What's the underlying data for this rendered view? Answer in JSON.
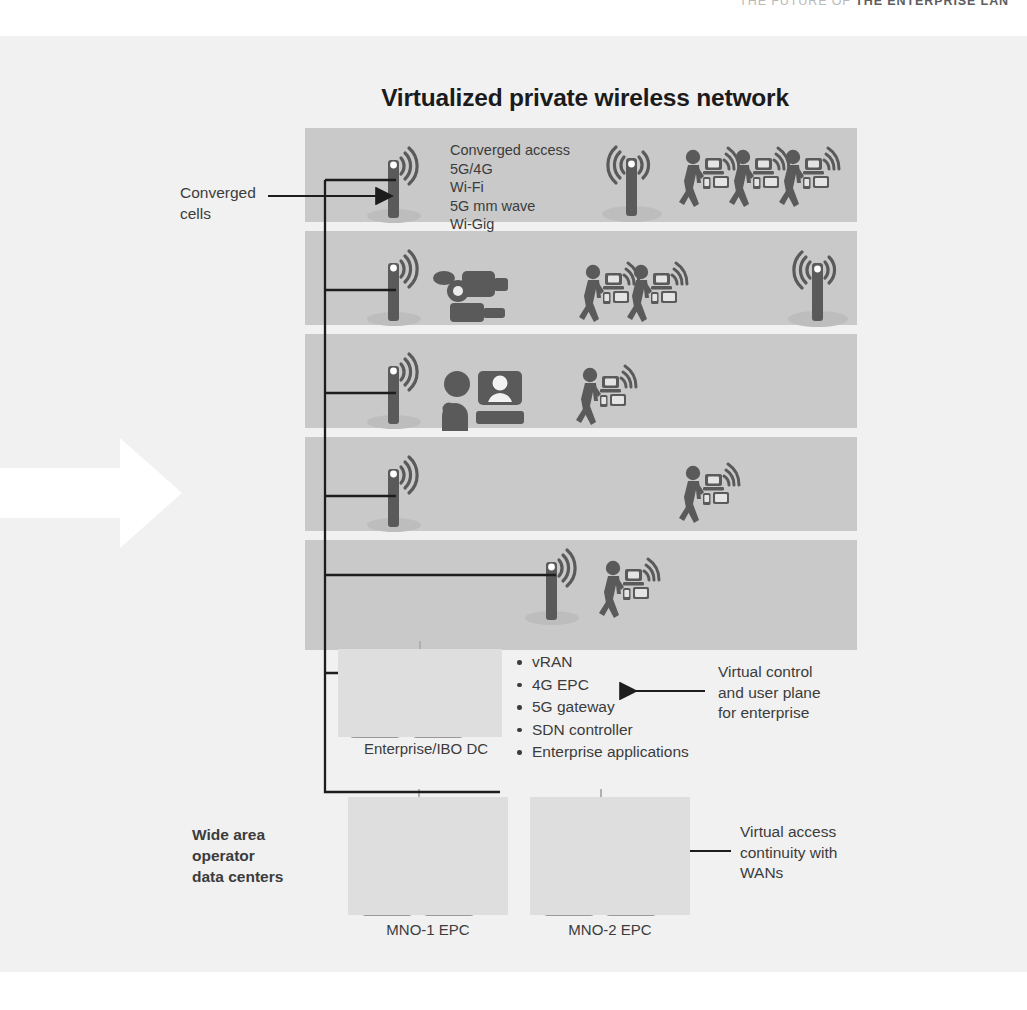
{
  "running_head": {
    "prefix": "THE FUTURE OF ",
    "strong": "THE ENTERPRISE LAN"
  },
  "diagram": {
    "title": "Virtualized private wireless network",
    "type": "architecture-diagram",
    "colors": {
      "panel_background": "#f1f1f1",
      "floor_fill": "#c9c9c9",
      "datacenter_fill": "#dedede",
      "icon_fill": "#5a5a5a",
      "rack_fill": "#9a9a9a",
      "line": "#222222",
      "title_text": "#1b1b1b",
      "body_text": "#3c3c3c",
      "running_head_muted": "#b9b9b9",
      "entry_arrow": "#ffffff"
    }
  },
  "access_technologies": {
    "heading": "Converged access",
    "items": [
      "5G/4G",
      "Wi-Fi",
      "5G mm wave",
      "Wi-Gig"
    ],
    "full_text": "Converged access\n5G/4G\nWi-Fi\n5G mm wave\nWi-Gig"
  },
  "annotations": {
    "converged_cells": "Converged\ncells",
    "converged_cells_lines": [
      "Converged",
      "cells"
    ],
    "virtual_control": "Virtual control\nand user plane\nfor enterprise",
    "virtual_control_lines": [
      "Virtual control",
      "and user plane",
      "for enterprise"
    ],
    "virtual_access": "Virtual access\ncontinuity with\nWANs",
    "virtual_access_lines": [
      "Virtual access",
      "continuity with",
      "WANs"
    ],
    "wide_area": "Wide area\noperator\ndata centers",
    "wide_area_lines": [
      "Wide area",
      "operator",
      "data centers"
    ]
  },
  "floors": [
    {
      "id": "floor-1",
      "label": "Floor 1",
      "icons": [
        "cell-antenna-icon",
        "cell-antenna-icon",
        "walking-user-icon",
        "walking-user-icon",
        "walking-user-icon"
      ],
      "user_count": 3,
      "antenna_count": 2
    },
    {
      "id": "floor-2",
      "label": "Floor 2",
      "icons": [
        "cell-antenna-icon",
        "video-camera-icon",
        "walking-user-icon",
        "walking-user-icon",
        "cell-antenna-icon"
      ],
      "user_count": 2,
      "antenna_count": 2
    },
    {
      "id": "floor-3",
      "label": "Floor 3",
      "icons": [
        "cell-antenna-icon",
        "video-conference-icon",
        "walking-user-icon"
      ],
      "user_count": 1,
      "antenna_count": 1
    },
    {
      "id": "floor-4",
      "label": "Floor 4",
      "icons": [
        "cell-antenna-icon",
        "walking-user-icon"
      ],
      "user_count": 1,
      "antenna_count": 1
    },
    {
      "id": "floor-5",
      "label": "Floor 5",
      "icons": [
        "cell-antenna-icon",
        "walking-user-icon"
      ],
      "user_count": 1,
      "antenna_count": 1
    }
  ],
  "enterprise_dc": {
    "caption": "Enterprise/IBO DC",
    "rack_count": 2,
    "rack_units": 6,
    "storage_units": 2,
    "functions": [
      "vRAN",
      "4G EPC",
      "5G gateway",
      "SDN controller",
      "Enterprise applications"
    ]
  },
  "operator_dcs": [
    {
      "caption": "MNO-1 EPC",
      "rack_count": 2,
      "rack_units": 6,
      "storage_units": 2
    },
    {
      "caption": "MNO-2 EPC",
      "rack_count": 2,
      "rack_units": 6,
      "storage_units": 2
    }
  ]
}
